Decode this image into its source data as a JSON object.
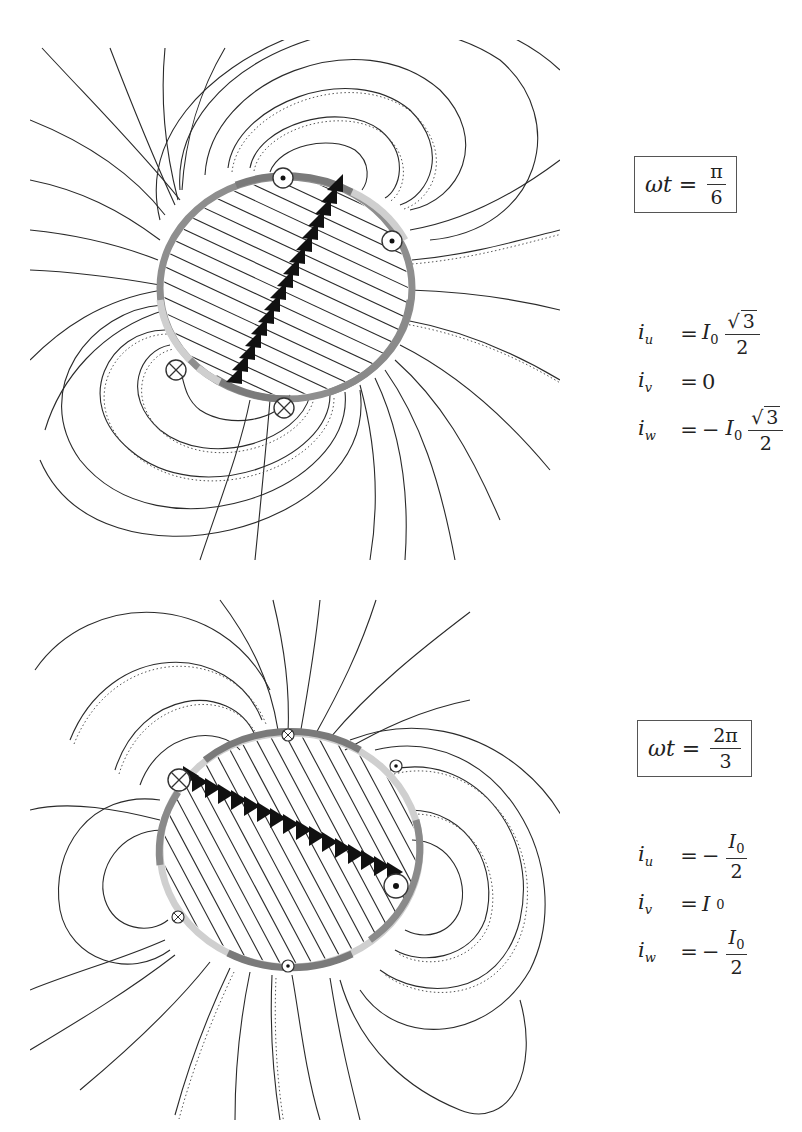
{
  "figure": {
    "colors": {
      "line": "#2a2a2a",
      "ring_dark": "#7a7a7a",
      "ring_mid": "#9a9a9a",
      "ring_light": "#cfcfcf",
      "arrow": "#111111",
      "box_border": "#555555"
    },
    "panels": [
      {
        "id": "pi-over-6",
        "label": {
          "lhs": "ωt =",
          "num": "π",
          "den": "6"
        },
        "currents": [
          {
            "name": "i",
            "sub": "u",
            "eq": "=",
            "sign": "",
            "coef": "I",
            "coef_sub": "0",
            "frac_num": "√3",
            "frac_den": "2"
          },
          {
            "name": "i",
            "sub": "v",
            "eq": "=",
            "value": "0"
          },
          {
            "name": "i",
            "sub": "w",
            "eq": "=",
            "sign": "−",
            "coef": "I",
            "coef_sub": "0",
            "frac_num": "√3",
            "frac_den": "2"
          }
        ],
        "conductor_symbols": [
          {
            "type": "dot-out",
            "symbol": "⊙"
          },
          {
            "type": "dot-out",
            "symbol": "⊙"
          },
          {
            "type": "cross-in",
            "symbol": "⊗"
          },
          {
            "type": "cross-in",
            "symbol": "⊗"
          }
        ],
        "field_axis_angle_deg": 60,
        "arrow_count": 17
      },
      {
        "id": "two-pi-over-3",
        "label": {
          "lhs": "ωt =",
          "num": "2π",
          "den": "3"
        },
        "currents": [
          {
            "name": "i",
            "sub": "u",
            "eq": "=",
            "sign": "−",
            "frac_num": "I0",
            "frac_den": "2"
          },
          {
            "name": "i",
            "sub": "v",
            "eq": "=",
            "value": "I0"
          },
          {
            "name": "i",
            "sub": "w",
            "eq": "=",
            "sign": "−",
            "frac_num": "I0",
            "frac_den": "2"
          }
        ],
        "conductor_symbols": [
          {
            "type": "cross-in",
            "symbol": "⊗"
          },
          {
            "type": "cross-in",
            "symbol": "⊗"
          },
          {
            "type": "cross-in",
            "symbol": "⊗"
          },
          {
            "type": "dot-out",
            "symbol": "⊙"
          },
          {
            "type": "dot-out",
            "symbol": "⊙"
          },
          {
            "type": "dot-out",
            "symbol": "⊙"
          }
        ],
        "field_axis_angle_deg": -30,
        "arrow_count": 17
      }
    ]
  },
  "labels": {
    "p1": {
      "lhs": "ωt =",
      "num": "π",
      "den": "6"
    },
    "p2": {
      "lhs": "ωt =",
      "num": "2π",
      "den": "3"
    }
  },
  "eq1": {
    "u": {
      "var": "i",
      "sub": "u",
      "eq": "=",
      "coef": "I",
      "coef_sub": "0",
      "num": "3",
      "den": "2"
    },
    "v": {
      "var": "i",
      "sub": "v",
      "eq": "=",
      "val": "0"
    },
    "w": {
      "var": "i",
      "sub": "w",
      "eq": "=",
      "sign": "−",
      "coef": "I",
      "coef_sub": "0",
      "num": "3",
      "den": "2"
    }
  },
  "eq2": {
    "u": {
      "var": "i",
      "sub": "u",
      "eq": "=",
      "sign": "−",
      "num": "I",
      "num_sub": "0",
      "den": "2"
    },
    "v": {
      "var": "i",
      "sub": "v",
      "eq": "=",
      "val": "I",
      "val_sub": "0"
    },
    "w": {
      "var": "i",
      "sub": "w",
      "eq": "=",
      "sign": "−",
      "num": "I",
      "num_sub": "0",
      "den": "2"
    }
  }
}
